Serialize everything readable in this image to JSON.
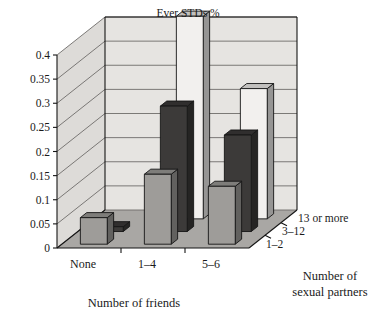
{
  "chart_data": {
    "type": "bar",
    "title": "Ever STDs %",
    "subtitle": "",
    "xlabel": "Number of friends",
    "zlabel": "Number of sexual partners",
    "ylabel": "",
    "categories": [
      "None",
      "1–4",
      "5–6"
    ],
    "depth_categories": [
      "1–2",
      "3–12",
      "13 or more"
    ],
    "series": [
      {
        "name": "1–2",
        "values": [
          0.055,
          0.145,
          0.12
        ]
      },
      {
        "name": "3–12",
        "values": [
          0.01,
          0.26,
          0.2
        ]
      },
      {
        "name": "13 or more",
        "values": [
          0.0,
          0.42,
          0.27
        ]
      }
    ],
    "ylim": [
      0,
      0.4
    ],
    "ytick_labels": [
      "0",
      "0.05",
      "0.1",
      "0.15",
      "0.2",
      "0.25",
      "0.3",
      "0.35",
      "0.4"
    ],
    "ytick_values": [
      0,
      0.05,
      0.1,
      0.15,
      0.2,
      0.25,
      0.3,
      0.35,
      0.4
    ],
    "grid": true,
    "legend": "none",
    "projection": "3d"
  },
  "colors": {
    "series_1_2_face": "#9e9c99",
    "series_3_12_face": "#3c3a39",
    "series_13_more_face": "#f2f0ee",
    "back_wall": "#e6e4e1",
    "left_wall": "#dddbd8",
    "floor": "#a9a7a4",
    "gridline": "#6e6c6a",
    "outline": "#151515",
    "text": "#1a1a1a"
  }
}
